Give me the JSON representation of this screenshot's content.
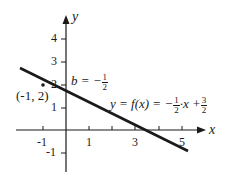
{
  "diagram": {
    "axes": {
      "x_label": "x",
      "y_label": "y",
      "x_ticks": [
        "-1",
        "1",
        "3",
        "5"
      ],
      "y_ticks": [
        "4",
        "3",
        "2",
        "1",
        "-1"
      ]
    },
    "point_label": "(-1, 2)",
    "intercept_label": {
      "prefix": "b = −",
      "num": "1",
      "den": "2"
    },
    "function_label": {
      "lhs": "y = f(x) = −",
      "num1": "1",
      "den1": "2",
      "mid": "·x +",
      "num2": "3",
      "den2": "2"
    },
    "line_color": "#1a1a1a"
  }
}
